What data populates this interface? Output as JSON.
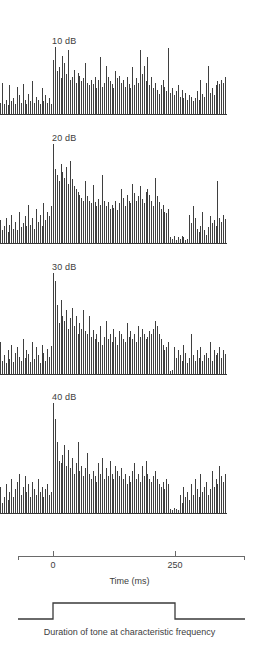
{
  "figure": {
    "axis_title": "Time (ms)",
    "caption": "Duration of tone at characteristic frequency",
    "bar_color": "#3f3f3f",
    "axis_color": "#6a6a6a",
    "text_color": "#3d3d3d"
  },
  "chart_data": {
    "type": "bar",
    "title": "",
    "xlabel": "Time (ms)",
    "ylabel": "",
    "xlim": [
      -110,
      385
    ],
    "tick_values": [
      0,
      250
    ],
    "tick_labels": [
      "0",
      "250"
    ],
    "grid": false,
    "legend": "none",
    "annotations": [
      "Duration of tone at characteristic frequency"
    ],
    "stimulus": {
      "onset_ms": 0,
      "offset_ms": 250,
      "label": "Duration of tone at characteristic frequency"
    },
    "panels": [
      {
        "label": "10 dB",
        "level_db": 10,
        "values": [
          8,
          22,
          7,
          10,
          6,
          20,
          9,
          11,
          7,
          19,
          13,
          8,
          21,
          10,
          7,
          14,
          9,
          23,
          8,
          12,
          10,
          7,
          18,
          9,
          13,
          8,
          11,
          7,
          38,
          47,
          30,
          33,
          25,
          41,
          36,
          28,
          45,
          24,
          26,
          31,
          22,
          29,
          27,
          23,
          25,
          36,
          22,
          20,
          24,
          21,
          26,
          18,
          24,
          40,
          19,
          22,
          34,
          26,
          23,
          21,
          18,
          30,
          25,
          27,
          22,
          24,
          19,
          26,
          21,
          18,
          33,
          20,
          25,
          22,
          45,
          28,
          34,
          23,
          40,
          20,
          26,
          18,
          22,
          17,
          14,
          20,
          24,
          19,
          16,
          46,
          15,
          18,
          13,
          16,
          20,
          12,
          17,
          11,
          15,
          10,
          13,
          12,
          9,
          11,
          16,
          10,
          24,
          14,
          12,
          22,
          34,
          15,
          18,
          13,
          20,
          23,
          21,
          24,
          22,
          26
        ]
      },
      {
        "label": "20 dB",
        "level_db": 20,
        "values": [
          16,
          9,
          12,
          18,
          8,
          13,
          20,
          10,
          15,
          9,
          22,
          11,
          14,
          19,
          12,
          27,
          13,
          18,
          10,
          24,
          15,
          20,
          12,
          28,
          16,
          22,
          19,
          26,
          70,
          52,
          48,
          44,
          56,
          50,
          46,
          54,
          42,
          58,
          45,
          40,
          38,
          36,
          34,
          32,
          30,
          44,
          33,
          30,
          28,
          41,
          29,
          26,
          31,
          27,
          48,
          30,
          26,
          29,
          24,
          27,
          25,
          30,
          23,
          28,
          38,
          32,
          26,
          34,
          30,
          28,
          42,
          35,
          30,
          33,
          40,
          31,
          28,
          36,
          38,
          34,
          30,
          26,
          46,
          33,
          29,
          24,
          27,
          22,
          21,
          24,
          4,
          3,
          5,
          2,
          4,
          3,
          5,
          4,
          2,
          3,
          20,
          14,
          26,
          18,
          10,
          8,
          12,
          22,
          9,
          6,
          11,
          19,
          14,
          16,
          12,
          44,
          18,
          15,
          20,
          17
        ]
      },
      {
        "label": "30 dB",
        "level_db": 30,
        "values": [
          24,
          10,
          14,
          8,
          18,
          11,
          22,
          9,
          16,
          20,
          13,
          10,
          26,
          12,
          18,
          15,
          9,
          24,
          11,
          20,
          14,
          8,
          22,
          16,
          10,
          19,
          13,
          21,
          76,
          70,
          52,
          38,
          56,
          44,
          40,
          48,
          34,
          42,
          50,
          36,
          44,
          30,
          38,
          34,
          48,
          32,
          30,
          44,
          28,
          33,
          26,
          30,
          24,
          36,
          22,
          28,
          40,
          26,
          30,
          24,
          34,
          28,
          22,
          32,
          30,
          26,
          24,
          38,
          28,
          32,
          26,
          30,
          24,
          36,
          28,
          34,
          30,
          26,
          28,
          32,
          30,
          34,
          40,
          36,
          30,
          26,
          22,
          18,
          20,
          24,
          2,
          3,
          20,
          12,
          18,
          14,
          10,
          22,
          16,
          8,
          12,
          30,
          14,
          10,
          18,
          12,
          20,
          10,
          14,
          16,
          12,
          24,
          10,
          18,
          14,
          16,
          20,
          12,
          18,
          15
        ]
      },
      {
        "label": "40 dB",
        "level_db": 40,
        "values": [
          20,
          8,
          12,
          22,
          10,
          16,
          26,
          12,
          18,
          24,
          30,
          14,
          20,
          28,
          16,
          22,
          12,
          24,
          18,
          14,
          26,
          16,
          20,
          12,
          18,
          22,
          14,
          16,
          84,
          72,
          54,
          40,
          38,
          44,
          52,
          36,
          48,
          34,
          42,
          30,
          38,
          54,
          32,
          36,
          28,
          34,
          46,
          30,
          26,
          32,
          28,
          24,
          38,
          30,
          42,
          26,
          34,
          28,
          40,
          30,
          26,
          36,
          32,
          28,
          34,
          26,
          30,
          22,
          28,
          24,
          32,
          38,
          26,
          30,
          24,
          36,
          28,
          40,
          30,
          26,
          24,
          28,
          32,
          26,
          22,
          20,
          24,
          18,
          26,
          22,
          3,
          2,
          4,
          3,
          2,
          14,
          8,
          20,
          12,
          16,
          10,
          22,
          14,
          26,
          18,
          12,
          30,
          16,
          20,
          24,
          14,
          18,
          32,
          20,
          26,
          22,
          36,
          28,
          24,
          30
        ]
      }
    ]
  }
}
